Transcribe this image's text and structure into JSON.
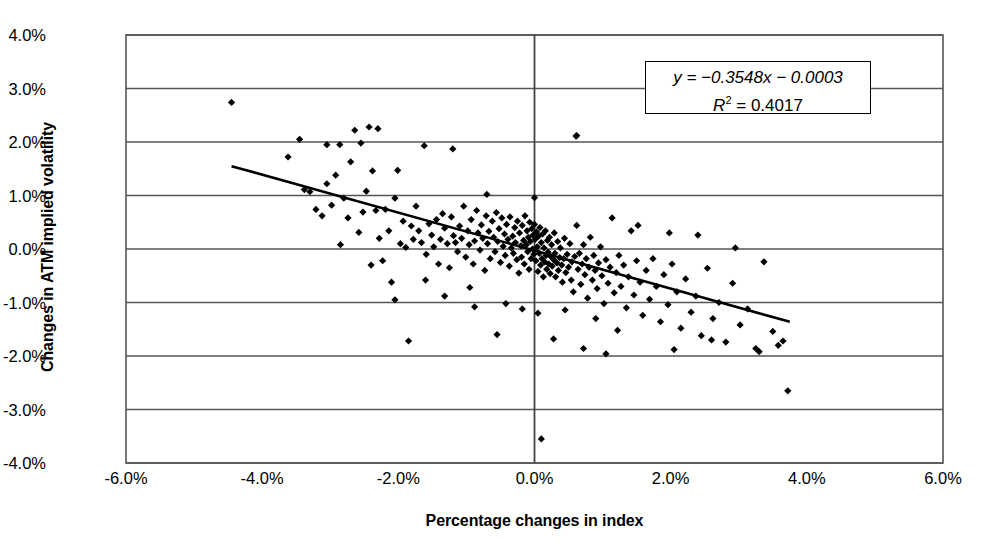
{
  "chart_data": {
    "type": "scatter",
    "title": "",
    "xlabel": "Percentage changes in index",
    "ylabel": "Changes in ATM implied volatility",
    "xlim": [
      -6.0,
      6.0
    ],
    "ylim": [
      -4.0,
      4.0
    ],
    "xtick_labels": [
      "-6.0%",
      "-4.0%",
      "-2.0%",
      "0.0%",
      "2.0%",
      "4.0%",
      "6.0%"
    ],
    "xtick_values": [
      -6.0,
      -4.0,
      -2.0,
      0.0,
      2.0,
      4.0,
      6.0
    ],
    "ytick_labels": [
      "4.0%",
      "3.0%",
      "2.0%",
      "1.0%",
      "0.0%",
      "-1.0%",
      "-2.0%",
      "-3.0%",
      "-4.0%"
    ],
    "ytick_values": [
      4.0,
      3.0,
      2.0,
      1.0,
      0.0,
      -1.0,
      -2.0,
      -3.0,
      -4.0
    ],
    "grid": "horizontal",
    "legend": "none",
    "marker": "diamond",
    "marker_color": "#000000",
    "annotation": {
      "equation": "y = −0.3548x − 0.0003",
      "r_squared_label": "R",
      "r_squared_exp": "2",
      "r_squared_value": " = 0.4017"
    },
    "trendline": {
      "slope": -0.3548,
      "intercept": -0.0003,
      "x_start": -4.45,
      "x_end": 3.75,
      "color": "#000000"
    },
    "series": [
      {
        "name": "Index change vs ATM implied volatility change",
        "points": [
          [
            -4.45,
            2.74
          ],
          [
            -3.62,
            1.72
          ],
          [
            -3.45,
            2.05
          ],
          [
            -3.38,
            1.11
          ],
          [
            -3.3,
            1.07
          ],
          [
            -3.21,
            0.74
          ],
          [
            -3.12,
            0.62
          ],
          [
            -3.05,
            1.22
          ],
          [
            -2.98,
            0.82
          ],
          [
            -2.92,
            1.38
          ],
          [
            -2.86,
            1.95
          ],
          [
            -2.8,
            0.95
          ],
          [
            -2.74,
            0.58
          ],
          [
            -2.7,
            1.63
          ],
          [
            -2.64,
            2.22
          ],
          [
            -2.58,
            0.31
          ],
          [
            -2.52,
            0.69
          ],
          [
            -2.47,
            1.08
          ],
          [
            -2.43,
            2.28
          ],
          [
            -2.38,
            1.46
          ],
          [
            -2.33,
            0.72
          ],
          [
            -2.28,
            0.2
          ],
          [
            -2.23,
            -0.22
          ],
          [
            -2.19,
            0.74
          ],
          [
            -2.14,
            0.34
          ],
          [
            -2.1,
            -0.62
          ],
          [
            -2.05,
            0.95
          ],
          [
            -2.01,
            1.47
          ],
          [
            -1.97,
            0.1
          ],
          [
            -1.93,
            0.52
          ],
          [
            -1.89,
            0.03
          ],
          [
            -1.85,
            -1.72
          ],
          [
            -1.81,
            0.43
          ],
          [
            -1.78,
            0.18
          ],
          [
            -1.74,
            0.8
          ],
          [
            -1.7,
            0.34
          ],
          [
            -1.66,
            0.12
          ],
          [
            -1.62,
            1.93
          ],
          [
            -1.59,
            -0.1
          ],
          [
            -1.55,
            0.47
          ],
          [
            -1.51,
            0.26
          ],
          [
            -1.48,
            0.04
          ],
          [
            -1.44,
            0.55
          ],
          [
            -1.41,
            -0.28
          ],
          [
            -1.38,
            0.18
          ],
          [
            -1.35,
            0.66
          ],
          [
            -1.32,
            0.39
          ],
          [
            -1.28,
            0.1
          ],
          [
            -1.25,
            -0.35
          ],
          [
            -1.22,
            0.6
          ],
          [
            -1.19,
            0.25
          ],
          [
            -1.16,
            0.12
          ],
          [
            -1.13,
            -0.05
          ],
          [
            -1.1,
            0.43
          ],
          [
            -1.07,
            0.2
          ],
          [
            -1.04,
            0.8
          ],
          [
            -1.01,
            -0.15
          ],
          [
            -0.98,
            0.34
          ],
          [
            -0.96,
            0.08
          ],
          [
            -0.93,
            0.55
          ],
          [
            -0.9,
            -0.28
          ],
          [
            -0.88,
            0.15
          ],
          [
            -0.85,
            0.72
          ],
          [
            -0.83,
            0.3
          ],
          [
            -0.8,
            -0.02
          ],
          [
            -0.78,
            0.45
          ],
          [
            -0.76,
            0.2
          ],
          [
            -0.73,
            -0.4
          ],
          [
            -0.71,
            0.62
          ],
          [
            -0.69,
            0.1
          ],
          [
            -0.67,
            0.33
          ],
          [
            -0.65,
            -0.18
          ],
          [
            -0.62,
            0.52
          ],
          [
            -0.6,
            0.22
          ],
          [
            -0.58,
            -0.05
          ],
          [
            -0.56,
            0.68
          ],
          [
            -0.54,
            0.14
          ],
          [
            -0.52,
            0.38
          ],
          [
            -0.5,
            -0.25
          ],
          [
            -0.48,
            0.58
          ],
          [
            -0.46,
            0.05
          ],
          [
            -0.44,
            0.28
          ],
          [
            -0.43,
            -0.12
          ],
          [
            -0.41,
            0.46
          ],
          [
            -0.39,
            0.18
          ],
          [
            -0.37,
            -0.32
          ],
          [
            -0.36,
            0.6
          ],
          [
            -0.34,
            0.02
          ],
          [
            -0.32,
            0.24
          ],
          [
            -0.31,
            -0.08
          ],
          [
            -0.29,
            0.4
          ],
          [
            -0.28,
            0.12
          ],
          [
            -0.26,
            -0.2
          ],
          [
            -0.25,
            0.52
          ],
          [
            -0.23,
            -0.45
          ],
          [
            -0.22,
            0.3
          ],
          [
            -0.2,
            0.06
          ],
          [
            -0.19,
            -0.15
          ],
          [
            -0.18,
            0.44
          ],
          [
            -0.16,
            0.16
          ],
          [
            -0.15,
            -0.28
          ],
          [
            -0.14,
            0.62
          ],
          [
            -0.12,
            0.08
          ],
          [
            -0.11,
            0.34
          ],
          [
            -0.1,
            -0.05
          ],
          [
            -0.09,
            0.22
          ],
          [
            -0.08,
            -0.38
          ],
          [
            -0.07,
            0.5
          ],
          [
            -0.06,
            0.14
          ],
          [
            -0.05,
            -0.18
          ],
          [
            -0.04,
            0.38
          ],
          [
            -0.03,
            0.0
          ],
          [
            -0.02,
            0.26
          ],
          [
            -0.01,
            -0.1
          ],
          [
            0.0,
            0.96
          ],
          [
            0.0,
            0.46
          ],
          [
            0.01,
            0.18
          ],
          [
            0.02,
            -0.22
          ],
          [
            0.03,
            0.32
          ],
          [
            0.04,
            0.04
          ],
          [
            0.05,
            -0.42
          ],
          [
            0.06,
            0.24
          ],
          [
            0.07,
            -0.08
          ],
          [
            0.08,
            0.4
          ],
          [
            0.09,
            -0.3
          ],
          [
            0.1,
            0.12
          ],
          [
            0.1,
            -3.55
          ],
          [
            0.11,
            -0.18
          ],
          [
            0.12,
            0.28
          ],
          [
            0.13,
            -0.52
          ],
          [
            0.14,
            0.02
          ],
          [
            0.15,
            -0.24
          ],
          [
            0.16,
            0.34
          ],
          [
            0.17,
            -0.12
          ],
          [
            0.18,
            -0.38
          ],
          [
            0.19,
            0.16
          ],
          [
            0.2,
            -0.06
          ],
          [
            0.21,
            -0.28
          ],
          [
            0.22,
            0.22
          ],
          [
            0.23,
            -0.46
          ],
          [
            0.24,
            -0.14
          ],
          [
            0.25,
            0.08
          ],
          [
            0.26,
            -0.32
          ],
          [
            0.28,
            -0.2
          ],
          [
            0.29,
            0.3
          ],
          [
            0.3,
            -0.08
          ],
          [
            0.31,
            -0.52
          ],
          [
            0.33,
            -0.26
          ],
          [
            0.34,
            0.14
          ],
          [
            0.35,
            -0.4
          ],
          [
            0.37,
            -0.16
          ],
          [
            0.38,
            0.02
          ],
          [
            0.4,
            -0.3
          ],
          [
            0.41,
            -0.62
          ],
          [
            0.43,
            -0.18
          ],
          [
            0.44,
            0.2
          ],
          [
            0.46,
            -0.44
          ],
          [
            0.48,
            -0.1
          ],
          [
            0.5,
            -0.34
          ],
          [
            0.52,
            0.1
          ],
          [
            0.54,
            -0.58
          ],
          [
            0.55,
            -0.24
          ],
          [
            0.57,
            -0.8
          ],
          [
            0.59,
            -0.14
          ],
          [
            0.61,
            2.11
          ],
          [
            0.62,
            0.44
          ],
          [
            0.64,
            -0.38
          ],
          [
            0.66,
            -0.08
          ],
          [
            0.68,
            -0.66
          ],
          [
            0.7,
            -0.28
          ],
          [
            0.72,
            0.08
          ],
          [
            0.74,
            -0.48
          ],
          [
            0.76,
            -0.18
          ],
          [
            0.78,
            -0.92
          ],
          [
            0.8,
            -0.34
          ],
          [
            0.82,
            0.22
          ],
          [
            0.85,
            -0.58
          ],
          [
            0.87,
            -0.12
          ],
          [
            0.89,
            -0.4
          ],
          [
            0.92,
            -0.74
          ],
          [
            0.94,
            -0.26
          ],
          [
            0.97,
            0.04
          ],
          [
            0.99,
            -0.5
          ],
          [
            1.02,
            -1.02
          ],
          [
            1.05,
            -0.2
          ],
          [
            1.08,
            -0.64
          ],
          [
            1.11,
            -0.34
          ],
          [
            1.14,
            0.58
          ],
          [
            1.17,
            -0.82
          ],
          [
            1.2,
            -0.44
          ],
          [
            1.24,
            -0.12
          ],
          [
            1.27,
            -0.7
          ],
          [
            1.31,
            -0.3
          ],
          [
            1.35,
            -1.1
          ],
          [
            1.38,
            -0.52
          ],
          [
            1.42,
            0.34
          ],
          [
            1.46,
            -0.86
          ],
          [
            1.5,
            -0.22
          ],
          [
            1.55,
            -0.62
          ],
          [
            1.59,
            -1.24
          ],
          [
            1.64,
            -0.4
          ],
          [
            1.69,
            -0.94
          ],
          [
            1.74,
            -0.18
          ],
          [
            1.79,
            -0.7
          ],
          [
            1.85,
            -1.36
          ],
          [
            1.9,
            -0.48
          ],
          [
            1.96,
            -1.04
          ],
          [
            2.02,
            -0.28
          ],
          [
            2.09,
            -0.8
          ],
          [
            2.15,
            -1.48
          ],
          [
            2.22,
            -0.56
          ],
          [
            2.3,
            -1.18
          ],
          [
            2.37,
            -0.88
          ],
          [
            2.45,
            -1.62
          ],
          [
            2.54,
            -0.36
          ],
          [
            2.62,
            -1.3
          ],
          [
            2.71,
            -1.0
          ],
          [
            2.81,
            -1.74
          ],
          [
            2.91,
            -0.64
          ],
          [
            3.02,
            -1.42
          ],
          [
            3.13,
            -1.12
          ],
          [
            3.25,
            -1.86
          ],
          [
            3.37,
            -0.24
          ],
          [
            3.5,
            -1.54
          ],
          [
            3.58,
            -1.8
          ],
          [
            3.65,
            -1.72
          ],
          [
            3.72,
            -2.65
          ],
          [
            -3.05,
            1.95
          ],
          [
            -2.55,
            1.98
          ],
          [
            -2.3,
            2.25
          ],
          [
            -1.2,
            1.87
          ],
          [
            -0.7,
            1.02
          ],
          [
            0.62,
            2.12
          ],
          [
            2.4,
            0.26
          ],
          [
            2.95,
            0.02
          ],
          [
            1.52,
            0.44
          ],
          [
            1.98,
            0.3
          ],
          [
            -0.55,
            -1.6
          ],
          [
            -0.42,
            -1.02
          ],
          [
            -0.88,
            -1.08
          ],
          [
            -1.32,
            -0.88
          ],
          [
            0.45,
            -1.14
          ],
          [
            0.9,
            -1.3
          ],
          [
            1.22,
            -1.52
          ],
          [
            -0.18,
            -1.12
          ],
          [
            0.05,
            -1.2
          ],
          [
            -2.05,
            -0.95
          ],
          [
            -1.6,
            -0.58
          ],
          [
            -0.95,
            -0.72
          ],
          [
            2.05,
            -1.88
          ],
          [
            2.6,
            -1.7
          ],
          [
            3.3,
            -1.92
          ],
          [
            -2.85,
            0.08
          ],
          [
            -2.4,
            -0.3
          ],
          [
            0.28,
            -1.68
          ],
          [
            0.72,
            -1.86
          ],
          [
            1.05,
            -1.96
          ]
        ]
      }
    ]
  }
}
